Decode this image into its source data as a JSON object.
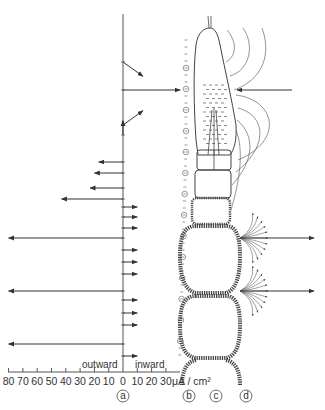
{
  "axis": {
    "unit_label": "μA / cm²",
    "tick_labels": [
      "80",
      "70",
      "60",
      "50",
      "40",
      "30",
      "20",
      "10",
      "0",
      "10",
      "20",
      "30"
    ],
    "tick_values": [
      -80,
      -70,
      -60,
      -50,
      -40,
      -30,
      -20,
      -10,
      0,
      10,
      20,
      30
    ],
    "outward_label": "outward",
    "inward_label": "inward"
  },
  "panel_labels": [
    "a",
    "b",
    "c",
    "d"
  ],
  "current_vectors": [
    {
      "position": 1,
      "direction": "diagonal-down-inward",
      "magnitude": 20
    },
    {
      "position": 2,
      "direction": "inward",
      "magnitude": 40
    },
    {
      "position": 3,
      "direction": "diagonal-up-inward",
      "magnitude": 20
    },
    {
      "position": 4,
      "direction": "upward",
      "magnitude": 10
    },
    {
      "position": 5,
      "direction": "outward",
      "magnitude": 17
    },
    {
      "position": 6,
      "direction": "outward",
      "magnitude": 20
    },
    {
      "position": 7,
      "direction": "outward",
      "magnitude": 23
    },
    {
      "position": 8,
      "direction": "outward",
      "magnitude": 43
    },
    {
      "position": 9,
      "direction": "inward",
      "magnitude": 10
    },
    {
      "position": 10,
      "direction": "inward",
      "magnitude": 10
    },
    {
      "position": 11,
      "direction": "inward",
      "magnitude": 10
    },
    {
      "position": 12,
      "direction": "outward",
      "magnitude": 80
    },
    {
      "position": 13,
      "direction": "inward",
      "magnitude": 10
    },
    {
      "position": 14,
      "direction": "inward",
      "magnitude": 10
    },
    {
      "position": 15,
      "direction": "inward",
      "magnitude": 10
    },
    {
      "position": 16,
      "direction": "outward",
      "magnitude": 80
    },
    {
      "position": 17,
      "direction": "inward",
      "magnitude": 10
    },
    {
      "position": 18,
      "direction": "inward",
      "magnitude": 10
    },
    {
      "position": 19,
      "direction": "inward",
      "magnitude": 10
    },
    {
      "position": 20,
      "direction": "outward",
      "magnitude": 80
    },
    {
      "position": 21,
      "direction": "inward",
      "magnitude": 10
    }
  ],
  "colors": {
    "ink": "#333333",
    "line": "#555555"
  }
}
